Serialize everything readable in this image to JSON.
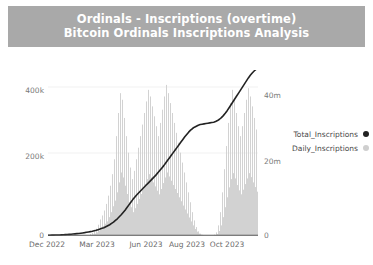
{
  "header": {
    "title": "Ordinals - Inscriptions (overtime)",
    "subtitle": "Bitcoin Ordinals Inscriptions Analysis",
    "band_color": "#a9a9a9",
    "text_color": "#ffffff"
  },
  "legend": {
    "position": "right",
    "items": [
      {
        "label": "Total_Inscriptions",
        "color": "#222222",
        "marker": "circle"
      },
      {
        "label": "Daily_Inscriptions",
        "color": "#cfcfcf",
        "marker": "circle"
      }
    ]
  },
  "axes": {
    "y_left": {
      "ticks": [
        "0",
        "200k",
        "400k"
      ],
      "values": [
        0,
        200000,
        400000
      ],
      "limits": [
        0,
        500000
      ]
    },
    "y_right": {
      "ticks": [
        "0",
        "20m",
        "40m"
      ],
      "values": [
        0,
        20000000,
        40000000
      ],
      "limits": [
        0,
        50000000
      ]
    },
    "x": {
      "ticks": [
        "Dec 2022",
        "Mar 2023",
        "Jun 2023",
        "Aug 2023",
        "Oct 2023"
      ]
    }
  },
  "chart_data": {
    "type": "line",
    "title": "Ordinals - Inscriptions (overtime)",
    "subtitle": "Bitcoin Ordinals Inscriptions Analysis",
    "xlabel": "",
    "ylabel": "",
    "grid": true,
    "legend_position": "right",
    "x_tick_labels": [
      "Dec 2022",
      "Mar 2023",
      "Jun 2023",
      "Aug 2023",
      "Oct 2023"
    ],
    "x_tick_positions": [
      0.02,
      0.255,
      0.49,
      0.685,
      0.875
    ],
    "y_left_ticks": [
      0,
      200000,
      400000
    ],
    "y_left_tick_labels": [
      "0",
      "200k",
      "400k"
    ],
    "y_left_lim": [
      0,
      500000
    ],
    "y_right_ticks": [
      0,
      20000000,
      40000000
    ],
    "y_right_tick_labels": [
      "0",
      "20m",
      "40m"
    ],
    "y_right_lim": [
      0,
      50000000
    ],
    "series": [
      {
        "name": "Daily_Inscriptions",
        "type": "bar",
        "axis": "left",
        "color": "#cfcfcf",
        "note": "Daily spiky bars, near zero until Feb 2023, highly volatile peaks up to ~450k, white gap (no data) near early Oct 2023",
        "values": [
          2,
          1,
          3,
          2,
          4,
          3,
          6,
          5,
          9,
          7,
          12,
          10,
          16,
          13,
          20,
          17,
          25,
          21,
          30,
          26,
          34,
          29,
          40,
          35,
          46,
          41,
          52,
          47,
          58,
          52,
          64,
          58,
          70,
          63,
          76,
          69,
          82,
          75,
          90,
          82,
          100,
          90,
          4000,
          1500,
          8000,
          3000,
          12000,
          5000,
          20000,
          9000,
          32000,
          14000,
          48000,
          22000,
          60000,
          28000,
          75000,
          35000,
          95000,
          42000,
          120000,
          55000,
          150000,
          70000,
          185000,
          88000,
          230000,
          105000,
          300000,
          130000,
          370000,
          160000,
          430000,
          190000,
          410000,
          175000,
          355000,
          150000,
          300000,
          125000,
          250000,
          100000,
          205000,
          85000,
          170000,
          70000,
          195000,
          82000,
          230000,
          95000,
          265000,
          110000,
          300000,
          125000,
          335000,
          140000,
          370000,
          155000,
          405000,
          170000,
          440000,
          185000,
          420000,
          175000,
          390000,
          160000,
          360000,
          148000,
          330000,
          135000,
          300000,
          124000,
          340000,
          140000,
          380000,
          158000,
          420000,
          175000,
          455000,
          190000,
          430000,
          178000,
          400000,
          165000,
          370000,
          152000,
          340000,
          140000,
          310000,
          128000,
          280000,
          115000,
          250000,
          103000,
          220000,
          90000,
          190000,
          78000,
          160000,
          66000,
          130000,
          54000,
          100000,
          42000,
          70000,
          30000,
          45000,
          19000,
          25000,
          11000,
          12000,
          5000,
          5000,
          2000,
          1500,
          600,
          0,
          0,
          0,
          0,
          0,
          0,
          0,
          0,
          0,
          0,
          2000,
          900,
          9000,
          4000,
          30000,
          13000,
          70000,
          30000,
          130000,
          55000,
          200000,
          85000,
          270000,
          115000,
          340000,
          145000,
          400000,
          170000,
          440000,
          188000,
          410000,
          172000,
          370000,
          152000,
          330000,
          136000,
          300000,
          124000,
          330000,
          138000,
          370000,
          155000,
          410000,
          172000,
          445000,
          188000,
          420000,
          176000,
          390000,
          160000,
          355000,
          146000,
          320000,
          132000
        ]
      },
      {
        "name": "Total_Inscriptions",
        "type": "line",
        "axis": "right",
        "color": "#222222",
        "note": "Cumulative monotonically increasing curve, flat near zero through Feb 2023, steady climb, plateau around Sep 2023 at ~34m, then steep rise to ~50m at right edge",
        "values": [
          0.02,
          0.03,
          0.04,
          0.05,
          0.07,
          0.09,
          0.11,
          0.14,
          0.17,
          0.2,
          0.24,
          0.28,
          0.33,
          0.38,
          0.44,
          0.5,
          0.57,
          0.64,
          0.72,
          0.8,
          0.9,
          1.0,
          1.1,
          1.2,
          1.35,
          1.5,
          1.7,
          1.9,
          2.1,
          2.3,
          2.6,
          2.9,
          3.2,
          3.6,
          4.0,
          4.5,
          5.0,
          5.6,
          6.2,
          6.9,
          7.6,
          8.4,
          9.2,
          10.0,
          10.8,
          11.5,
          12.2,
          12.8,
          13.4,
          14.0,
          14.6,
          15.2,
          15.8,
          16.4,
          17.0,
          17.6,
          18.2,
          18.9,
          19.6,
          20.3,
          21.0,
          21.8,
          22.6,
          23.4,
          24.2,
          25.0,
          25.8,
          26.6,
          27.4,
          28.2,
          29.0,
          29.8,
          30.5,
          31.2,
          31.8,
          32.3,
          32.7,
          33.0,
          33.3,
          33.5,
          33.6,
          33.7,
          33.8,
          33.9,
          34.0,
          34.1,
          34.2,
          34.4,
          34.7,
          35.1,
          35.6,
          36.2,
          36.9,
          37.7,
          38.6,
          39.5,
          40.4,
          41.3,
          42.2,
          43.1,
          44.0,
          44.9,
          45.8,
          46.7,
          47.6,
          48.4,
          49.1,
          49.7,
          50.2,
          50.6
        ],
        "unit": "millions"
      }
    ]
  }
}
